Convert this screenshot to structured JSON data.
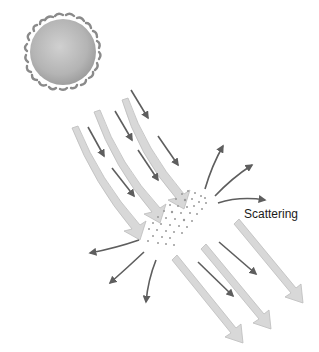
{
  "diagram": {
    "labels": {
      "scattering": "Scattering"
    },
    "elements": {
      "sun": {
        "icon": "sun-icon",
        "fill": "#b5b5b5"
      },
      "incoming_beams": {
        "count": 4,
        "color": "#d6d6d6"
      },
      "incoming_rays": {
        "count": 6,
        "color": "#666666"
      },
      "particle_cloud": {
        "icon": "particles-icon",
        "color": "#9a9a9a"
      },
      "scattered_rays": {
        "count": 6,
        "color": "#666666"
      },
      "transmitted_beams": {
        "count": 3,
        "color": "#d6d6d6"
      },
      "transmitted_rays": {
        "count": 2,
        "color": "#666666"
      }
    }
  }
}
